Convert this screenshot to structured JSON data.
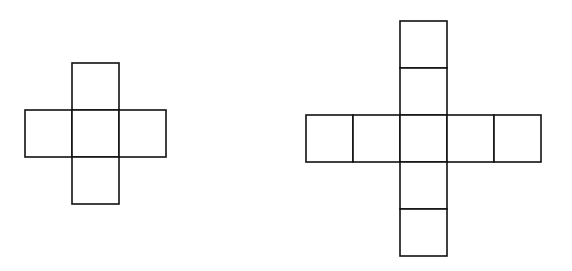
{
  "diagram": {
    "figures": [
      {
        "name": "small-cross",
        "arm_length": 1,
        "cells": [
          [
            0,
            -1
          ],
          [
            -1,
            0
          ],
          [
            0,
            0
          ],
          [
            1,
            0
          ],
          [
            0,
            1
          ]
        ],
        "total_squares": 5
      },
      {
        "name": "large-cross",
        "arm_length": 2,
        "cells": [
          [
            0,
            -2
          ],
          [
            0,
            -1
          ],
          [
            -2,
            0
          ],
          [
            -1,
            0
          ],
          [
            0,
            0
          ],
          [
            1,
            0
          ],
          [
            2,
            0
          ],
          [
            0,
            1
          ],
          [
            0,
            2
          ]
        ],
        "total_squares": 9
      }
    ],
    "colors": {
      "stroke": "#111111",
      "fill": "#ffffff",
      "background": "#ffffff"
    }
  }
}
